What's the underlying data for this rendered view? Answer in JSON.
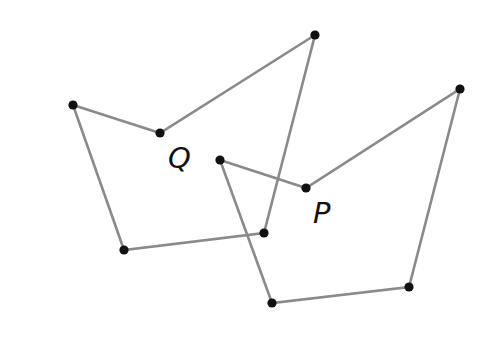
{
  "diagram": {
    "type": "geometry-figure",
    "colors": {
      "edge": "#8a8a8a",
      "vertex": "#111111",
      "label": "#111111",
      "background": "#ffffff"
    },
    "polygons": [
      {
        "name": "Q",
        "label": "Q",
        "label_position": [
          168,
          168
        ],
        "vertices": [
          [
            73,
            105
          ],
          [
            160,
            133
          ],
          [
            315,
            35
          ],
          [
            264,
            233
          ],
          [
            124,
            250
          ]
        ]
      },
      {
        "name": "P",
        "label": "P",
        "label_position": [
          313,
          223
        ],
        "vertices": [
          [
            220,
            160
          ],
          [
            306,
            188
          ],
          [
            460,
            89
          ],
          [
            409,
            287
          ],
          [
            272,
            303
          ]
        ]
      }
    ]
  }
}
